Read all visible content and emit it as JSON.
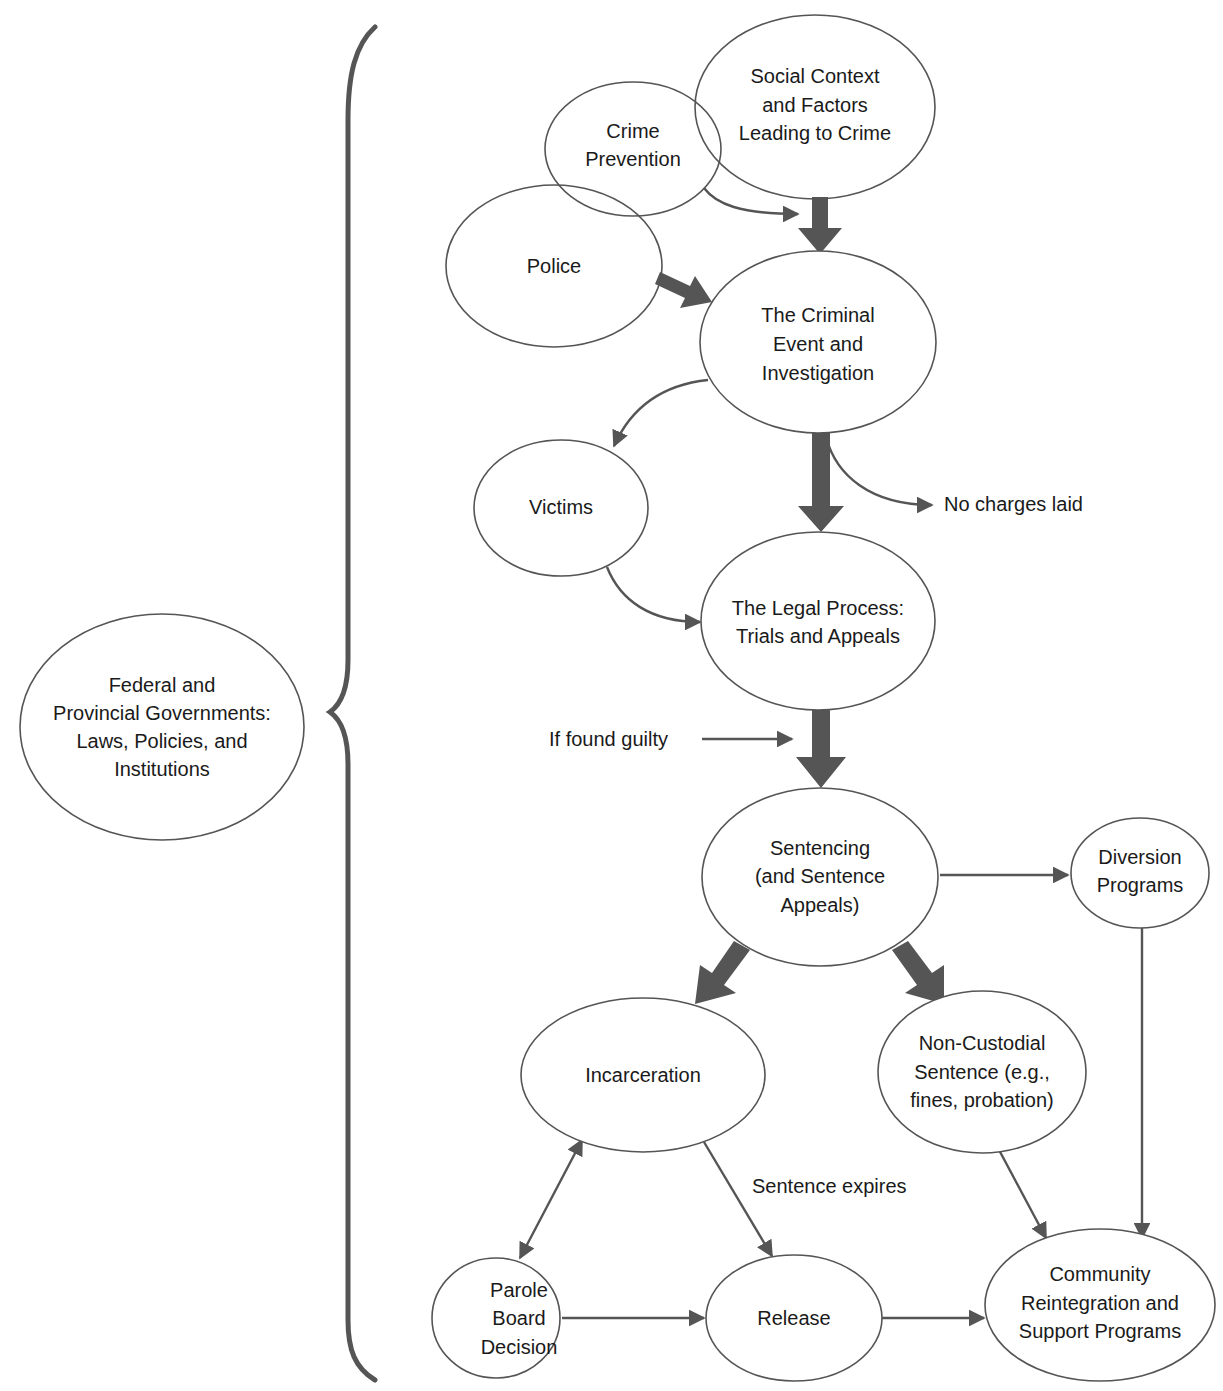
{
  "diagram": {
    "type": "flowchart",
    "title": "",
    "colors": {
      "stroke": "#555555",
      "text": "#1a1a1a",
      "background": "#ffffff"
    },
    "bracket_node": {
      "id": "gov",
      "lines": [
        "Federal and",
        "Provincial Governments:",
        "Laws, Policies, and",
        "Institutions"
      ]
    },
    "nodes": {
      "social": {
        "lines": [
          "Social Context",
          "and Factors",
          "Leading to Crime"
        ]
      },
      "prevention": {
        "lines": [
          "Crime",
          "Prevention"
        ]
      },
      "police": {
        "lines": [
          "Police"
        ]
      },
      "criminal": {
        "lines": [
          "The Criminal",
          "Event and",
          "Investigation"
        ]
      },
      "victims": {
        "lines": [
          "Victims"
        ]
      },
      "legal": {
        "lines": [
          "The Legal Process:",
          "Trials and Appeals"
        ]
      },
      "sentencing": {
        "lines": [
          "Sentencing",
          "(and Sentence",
          "Appeals)"
        ]
      },
      "diversion": {
        "lines": [
          "Diversion",
          "Programs"
        ]
      },
      "incarceration": {
        "lines": [
          "Incarceration"
        ]
      },
      "noncustodial": {
        "lines": [
          "Non-Custodial",
          "Sentence (e.g.,",
          "fines, probation)"
        ]
      },
      "parole": {
        "lines": [
          "Parole",
          "Board",
          "Decision"
        ]
      },
      "release": {
        "lines": [
          "Release"
        ]
      },
      "community": {
        "lines": [
          "Community",
          "Reintegration and",
          "Support Programs"
        ]
      }
    },
    "edge_labels": {
      "no_charges": "No charges laid",
      "if_guilty": "If found guilty",
      "sentence_expires": "Sentence expires"
    },
    "edges": [
      {
        "from": "social",
        "to": "criminal",
        "style": "thick"
      },
      {
        "from": "prevention",
        "to": "criminal",
        "style": "thin"
      },
      {
        "from": "police",
        "to": "criminal",
        "style": "thick"
      },
      {
        "from": "criminal",
        "to": "victims",
        "style": "thin"
      },
      {
        "from": "criminal",
        "to": "legal",
        "style": "thick"
      },
      {
        "from": "criminal",
        "to": "no_charges",
        "style": "thin"
      },
      {
        "from": "victims",
        "to": "legal",
        "style": "thin"
      },
      {
        "from": "legal",
        "to": "sentencing",
        "style": "thick",
        "label": "If found guilty"
      },
      {
        "from": "sentencing",
        "to": "diversion",
        "style": "thin"
      },
      {
        "from": "sentencing",
        "to": "incarceration",
        "style": "thick"
      },
      {
        "from": "sentencing",
        "to": "noncustodial",
        "style": "thick"
      },
      {
        "from": "incarceration",
        "to": "parole",
        "style": "thin",
        "bidirectional": true
      },
      {
        "from": "incarceration",
        "to": "release",
        "style": "thin",
        "label": "Sentence expires"
      },
      {
        "from": "parole",
        "to": "release",
        "style": "thin"
      },
      {
        "from": "release",
        "to": "community",
        "style": "thin"
      },
      {
        "from": "noncustodial",
        "to": "community",
        "style": "thin"
      },
      {
        "from": "diversion",
        "to": "community",
        "style": "thin"
      }
    ]
  }
}
